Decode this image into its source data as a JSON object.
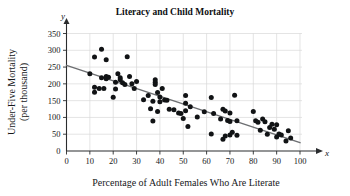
{
  "chart_data": {
    "type": "scatter",
    "title": "Literacy and Child Mortality",
    "xlabel": "Percentage of Adult Females Who Are Literate",
    "ylabel": "Under-Five Mortality\n(per thousand)",
    "ylabel_line1": "Under-Five Mortality",
    "ylabel_line2": "(per thousand)",
    "x_axis_variable": "x",
    "y_axis_variable": "y",
    "xlim": [
      0,
      100
    ],
    "ylim": [
      0,
      350
    ],
    "xticks": [
      0,
      10,
      20,
      30,
      40,
      50,
      60,
      70,
      80,
      90,
      100
    ],
    "yticks": [
      0,
      50,
      100,
      150,
      200,
      250,
      300,
      350
    ],
    "grid": true,
    "legend": "none",
    "point_color": "#111315",
    "trendline_color": "#6d6f72",
    "grid_color": "#d8d8d8",
    "axis_color": "#2a2c2e",
    "trendline": {
      "label": "least-squares regression line",
      "x_start": 0,
      "y_start": 255,
      "x_end": 100,
      "y_end": 25
    },
    "points": [
      [
        10,
        230
      ],
      [
        12,
        280
      ],
      [
        12,
        190
      ],
      [
        12,
        175
      ],
      [
        14,
        186
      ],
      [
        15,
        303
      ],
      [
        15,
        218
      ],
      [
        16,
        186
      ],
      [
        17,
        272
      ],
      [
        17,
        222
      ],
      [
        17,
        215
      ],
      [
        18,
        220
      ],
      [
        20,
        160
      ],
      [
        21,
        205
      ],
      [
        21,
        185
      ],
      [
        22,
        230
      ],
      [
        23,
        218
      ],
      [
        23,
        212
      ],
      [
        24,
        203
      ],
      [
        25,
        198
      ],
      [
        26,
        281
      ],
      [
        27,
        222
      ],
      [
        28,
        200
      ],
      [
        29,
        186
      ],
      [
        30,
        207
      ],
      [
        33,
        153
      ],
      [
        35,
        165
      ],
      [
        36,
        126
      ],
      [
        37,
        148
      ],
      [
        37,
        89
      ],
      [
        38,
        205
      ],
      [
        38,
        212
      ],
      [
        38,
        198
      ],
      [
        39,
        174
      ],
      [
        39,
        118
      ],
      [
        40,
        161
      ],
      [
        40,
        147
      ],
      [
        41,
        186
      ],
      [
        42,
        152
      ],
      [
        43,
        151
      ],
      [
        44,
        124
      ],
      [
        46,
        123
      ],
      [
        48,
        113
      ],
      [
        49,
        112
      ],
      [
        50,
        97
      ],
      [
        51,
        165
      ],
      [
        51,
        142
      ],
      [
        51,
        120
      ],
      [
        52,
        73
      ],
      [
        53,
        132
      ],
      [
        56,
        101
      ],
      [
        59,
        117
      ],
      [
        62,
        159
      ],
      [
        62,
        51
      ],
      [
        63,
        112
      ],
      [
        66,
        95
      ],
      [
        67,
        124
      ],
      [
        67,
        35
      ],
      [
        68,
        119
      ],
      [
        68,
        45
      ],
      [
        69,
        91
      ],
      [
        70,
        113
      ],
      [
        70,
        88
      ],
      [
        70,
        48
      ],
      [
        71,
        56
      ],
      [
        72,
        166
      ],
      [
        73,
        47
      ],
      [
        73,
        90
      ],
      [
        80,
        118
      ],
      [
        81,
        90
      ],
      [
        82,
        86
      ],
      [
        83,
        62
      ],
      [
        84,
        95
      ],
      [
        85,
        87
      ],
      [
        86,
        50
      ],
      [
        87,
        70
      ],
      [
        88,
        80
      ],
      [
        89,
        65
      ],
      [
        90,
        78
      ],
      [
        90,
        42
      ],
      [
        91,
        51
      ],
      [
        92,
        48
      ],
      [
        94,
        30
      ],
      [
        95,
        60
      ],
      [
        96,
        39
      ]
    ]
  }
}
